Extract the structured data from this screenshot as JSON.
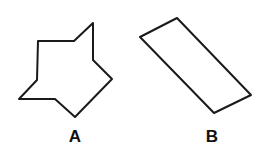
{
  "figure": {
    "background": "#ffffff",
    "stroke_color": "#1a1a1a",
    "shapes": [
      {
        "id": "A",
        "label": "A",
        "type": "nine-sided irregular polygon (star-like)",
        "points": "93,23 74,41 38,41 37,80 19,99 55,99 75,117 112,79 93,60",
        "label_x": 75,
        "label_y": 142
      },
      {
        "id": "B",
        "label": "B",
        "type": "parallelogram (tilted rectangle)",
        "points": "177,18 140,37 214,113 251,95",
        "label_x": 212,
        "label_y": 142
      }
    ]
  }
}
